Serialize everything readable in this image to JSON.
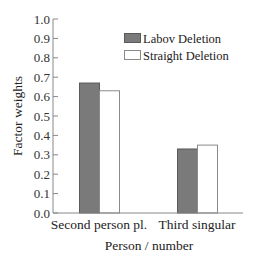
{
  "chart_data": {
    "type": "bar",
    "title": "",
    "xlabel": "Person / number",
    "ylabel": "Factor weights",
    "ylim": [
      0.0,
      1.0
    ],
    "yticks": [
      "0.0",
      "0.1",
      "0.2",
      "0.3",
      "0.4",
      "0.5",
      "0.6",
      "0.7",
      "0.8",
      "0.9",
      "1.0"
    ],
    "categories": [
      "Second person pl.",
      "Third singular"
    ],
    "series": [
      {
        "name": "Labov Deletion",
        "values": [
          0.67,
          0.33
        ],
        "color": "#7a7a7a"
      },
      {
        "name": "Straight Deletion",
        "values": [
          0.63,
          0.35
        ],
        "color": "#ffffff"
      }
    ],
    "grid": false,
    "legend_position": "upper right"
  }
}
